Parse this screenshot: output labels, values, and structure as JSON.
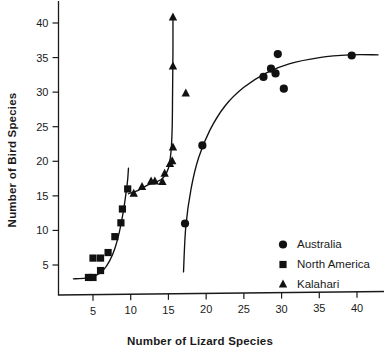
{
  "chart_data": {
    "type": "scatter",
    "title": "",
    "xlabel": "Number of Lizard Species",
    "ylabel": "Number of Bird Species",
    "xlim": [
      2.0,
      43.5
    ],
    "ylim": [
      1.5,
      42.5
    ],
    "xticks": [
      5,
      10,
      15,
      20,
      25,
      30,
      35,
      40
    ],
    "yticks": [
      5,
      10,
      15,
      20,
      25,
      30,
      35,
      40
    ],
    "xtick_labels": [
      "5",
      "10",
      "15",
      "20",
      "25",
      "30",
      "35",
      "40"
    ],
    "ytick_labels": [
      "5",
      "10",
      "15",
      "20",
      "25",
      "30",
      "35",
      "40"
    ],
    "grid": false,
    "legend_position": "lower-right",
    "series": [
      {
        "name": "Australia",
        "marker": "circle",
        "color": "#111111",
        "points": [
          [
            17.2,
            11.0
          ],
          [
            19.5,
            22.3
          ],
          [
            27.6,
            32.2
          ],
          [
            28.6,
            33.4
          ],
          [
            29.2,
            32.7
          ],
          [
            29.5,
            35.5
          ],
          [
            30.3,
            30.5
          ],
          [
            39.3,
            35.3
          ]
        ],
        "fit_curve": [
          [
            17.0,
            4.0
          ],
          [
            17.3,
            10.5
          ],
          [
            18.0,
            16.0
          ],
          [
            19.0,
            20.5
          ],
          [
            20.5,
            24.5
          ],
          [
            22.5,
            28.0
          ],
          [
            25.0,
            30.7
          ],
          [
            28.0,
            32.8
          ],
          [
            31.0,
            34.1
          ],
          [
            35.0,
            35.0
          ],
          [
            39.0,
            35.4
          ],
          [
            42.8,
            35.4
          ]
        ]
      },
      {
        "name": "North America",
        "marker": "square",
        "color": "#111111",
        "points": [
          [
            4.4,
            3.2
          ],
          [
            5.0,
            3.2
          ],
          [
            5.0,
            6.0
          ],
          [
            6.0,
            4.2
          ],
          [
            6.0,
            6.0
          ],
          [
            7.0,
            6.8
          ],
          [
            7.9,
            9.1
          ],
          [
            8.7,
            11.1
          ],
          [
            8.9,
            13.1
          ],
          [
            9.6,
            16.0
          ]
        ],
        "fit_curve": [
          [
            2.4,
            3.0
          ],
          [
            4.0,
            3.1
          ],
          [
            5.4,
            3.5
          ],
          [
            6.4,
            4.3
          ],
          [
            7.2,
            5.6
          ],
          [
            7.9,
            7.4
          ],
          [
            8.5,
            9.8
          ],
          [
            9.0,
            12.6
          ],
          [
            9.4,
            15.6
          ],
          [
            9.6,
            17.4
          ],
          [
            9.7,
            19.0
          ]
        ]
      },
      {
        "name": "Kalahari",
        "marker": "triangle",
        "color": "#111111",
        "points": [
          [
            10.4,
            15.3
          ],
          [
            11.5,
            16.3
          ],
          [
            12.7,
            17.1
          ],
          [
            13.2,
            17.1
          ],
          [
            14.2,
            17.0
          ],
          [
            14.5,
            18.2
          ],
          [
            15.2,
            19.6
          ],
          [
            15.5,
            20.0
          ],
          [
            15.6,
            22.0
          ],
          [
            15.6,
            33.7
          ],
          [
            15.6,
            40.8
          ],
          [
            17.3,
            29.8
          ]
        ],
        "fit_curve": [
          [
            9.7,
            15.3
          ],
          [
            11.0,
            15.8
          ],
          [
            12.3,
            16.6
          ],
          [
            13.4,
            17.0
          ],
          [
            14.3,
            17.6
          ],
          [
            15.0,
            19.0
          ],
          [
            15.35,
            21.5
          ],
          [
            15.5,
            25.0
          ],
          [
            15.55,
            30.0
          ],
          [
            15.6,
            36.0
          ],
          [
            15.6,
            41.0
          ]
        ]
      }
    ]
  },
  "legend": {
    "items": [
      {
        "label": "Australia",
        "marker": "circle"
      },
      {
        "label": "North America",
        "marker": "square"
      },
      {
        "label": "Kalahari",
        "marker": "triangle"
      }
    ]
  }
}
